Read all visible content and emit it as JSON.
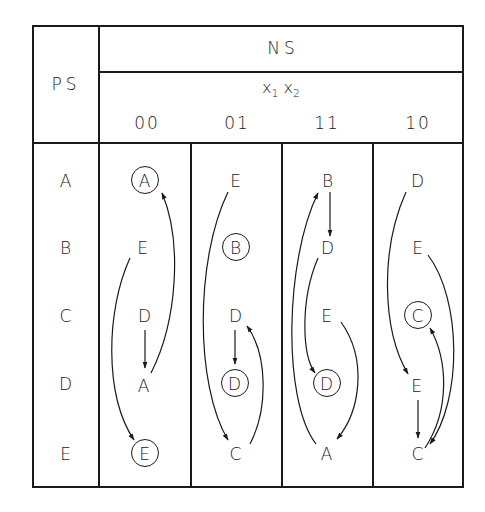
{
  "table": {
    "ps_header": "PS",
    "ns_header": "NS",
    "input_header": {
      "var1": "x",
      "sub1": "1",
      "var2": "x",
      "sub2": "2"
    },
    "columns": [
      "00",
      "01",
      "11",
      "10"
    ],
    "rows": [
      {
        "ps": "A",
        "cells": [
          {
            "v": "A",
            "stable": true
          },
          {
            "v": "E",
            "stable": false
          },
          {
            "v": "B",
            "stable": false
          },
          {
            "v": "D",
            "stable": false
          }
        ]
      },
      {
        "ps": "B",
        "cells": [
          {
            "v": "E",
            "stable": false
          },
          {
            "v": "B",
            "stable": true
          },
          {
            "v": "D",
            "stable": false
          },
          {
            "v": "E",
            "stable": false
          }
        ]
      },
      {
        "ps": "C",
        "cells": [
          {
            "v": "D",
            "stable": false
          },
          {
            "v": "D",
            "stable": false
          },
          {
            "v": "E",
            "stable": false
          },
          {
            "v": "C",
            "stable": true
          }
        ]
      },
      {
        "ps": "D",
        "cells": [
          {
            "v": "A",
            "stable": false
          },
          {
            "v": "D",
            "stable": true
          },
          {
            "v": "D",
            "stable": true
          },
          {
            "v": "E",
            "stable": false
          }
        ]
      },
      {
        "ps": "E",
        "cells": [
          {
            "v": "E",
            "stable": true
          },
          {
            "v": "C",
            "stable": false
          },
          {
            "v": "A",
            "stable": false
          },
          {
            "v": "C",
            "stable": false
          }
        ]
      }
    ]
  },
  "transitions": [
    {
      "column": "00",
      "from_row": "C",
      "to_row": "D",
      "shape": "straight"
    },
    {
      "column": "00",
      "from_row": "D",
      "to_row": "A",
      "shape": "curve-right"
    },
    {
      "column": "00",
      "from_row": "B",
      "to_row": "E",
      "shape": "curve-left"
    },
    {
      "column": "01",
      "from_row": "A",
      "to_row": "E",
      "shape": "curve-left"
    },
    {
      "column": "01",
      "from_row": "C",
      "to_row": "D",
      "shape": "straight"
    },
    {
      "column": "01",
      "from_row": "E",
      "to_row": "C",
      "shape": "curve-right"
    },
    {
      "column": "11",
      "from_row": "A",
      "to_row": "B",
      "shape": "straight"
    },
    {
      "column": "11",
      "from_row": "B",
      "to_row": "D",
      "shape": "curve-left"
    },
    {
      "column": "11",
      "from_row": "E",
      "to_row": "A",
      "shape": "curve-left-outer"
    },
    {
      "column": "11",
      "from_row": "C",
      "to_row": "E",
      "shape": "curve-right"
    },
    {
      "column": "10",
      "from_row": "A",
      "to_row": "D",
      "shape": "curve-left"
    },
    {
      "column": "10",
      "from_row": "D",
      "to_row": "E",
      "shape": "straight"
    },
    {
      "column": "10",
      "from_row": "B",
      "to_row": "E",
      "shape": "curve-right-outer"
    },
    {
      "column": "10",
      "from_row": "E",
      "to_row": "C",
      "shape": "curve-right"
    }
  ],
  "colors": {
    "ink": "#1a1a1a",
    "background": "#ffffff"
  }
}
